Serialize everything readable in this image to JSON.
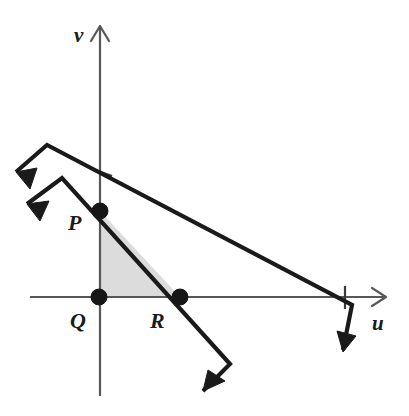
{
  "figure": {
    "background_color": "#ffffff",
    "line_color": "#1a1a1a",
    "axis_color": "#58585a",
    "region_fill_color": "#dcdcdc"
  },
  "axes": {
    "horizontal": {
      "name": "u-axis",
      "label": "u",
      "label_position": {
        "x": 372,
        "y": 330
      },
      "start": {
        "x": 30,
        "y": 297
      },
      "end": {
        "x": 386,
        "y": 297
      },
      "arrow_direction": "right"
    },
    "vertical": {
      "name": "v-axis",
      "label": "v",
      "label_position": {
        "x": 74,
        "y": 42
      },
      "start": {
        "x": 100,
        "y": 396
      },
      "end": {
        "x": 100,
        "y": 26
      },
      "arrow_direction": "up"
    },
    "ticks": [
      {
        "name": "u-axis-intercept-tick",
        "axis": "u",
        "x": 345,
        "y": 297
      },
      {
        "name": "v-axis-intercept-tick",
        "axis": "v",
        "x": 100,
        "y": 172
      }
    ]
  },
  "points": [
    {
      "id": "P",
      "label": "P",
      "x": 100,
      "y": 211,
      "label_x": 68,
      "label_y": 230,
      "description": "Intersection of steep line with the v-axis"
    },
    {
      "id": "Q",
      "label": "Q",
      "x": 99,
      "y": 297,
      "label_x": 70,
      "label_y": 328,
      "description": "Origin, intersection of u-axis and v-axis"
    },
    {
      "id": "R",
      "label": "R",
      "x": 180,
      "y": 297,
      "label_x": 150,
      "label_y": 328,
      "description": "Intersection of steep line with the u-axis"
    }
  ],
  "region": {
    "name": "shaded-triangle-PQR",
    "vertices": [
      "P",
      "Q",
      "R"
    ],
    "polygon": "100,211 99,297 180,297",
    "fill": "#dcdcdc"
  },
  "lines": [
    {
      "id": "steep-line",
      "name": "steep-constraint-line",
      "description": "Steeper line passing through P and R, arrows at both ends",
      "main_segment": {
        "from": {
          "x": 62,
          "y": 178
        },
        "to": {
          "x": 230,
          "y": 364
        }
      },
      "upper_arrow": {
        "kink": {
          "x": 62,
          "y": 178
        },
        "tip": {
          "x": 27,
          "y": 204
        },
        "direction": "down-left"
      },
      "lower_arrow": {
        "kink": {
          "x": 230,
          "y": 364
        },
        "tip": {
          "x": 203,
          "y": 391
        },
        "direction": "down-left"
      }
    },
    {
      "id": "shallow-line",
      "name": "shallow-constraint-line",
      "description": "Shallower line crossing the v-axis above P and the u-axis at the right tick",
      "main_segment": {
        "from": {
          "x": 47,
          "y": 145
        },
        "to": {
          "x": 352,
          "y": 305
        }
      },
      "upper_arrow": {
        "kink": {
          "x": 47,
          "y": 145
        },
        "tip": {
          "x": 16,
          "y": 172
        },
        "direction": "down-left"
      },
      "lower_arrow": {
        "kink": {
          "x": 352,
          "y": 305
        },
        "tip": {
          "x": 343,
          "y": 350
        },
        "direction": "down-left"
      }
    }
  ]
}
